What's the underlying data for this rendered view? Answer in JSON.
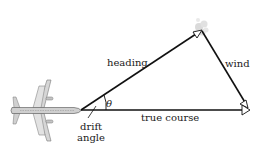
{
  "diagram": {
    "labels": {
      "heading": "heading",
      "wind": "wind",
      "true_course": "true course",
      "theta": "θ",
      "drift": "drift",
      "angle": "angle"
    },
    "icons": {
      "airplane": "airplane-icon",
      "cloud": "cloud-puff-icon"
    },
    "colors": {
      "line": "#111111",
      "background": "#ffffff",
      "airplane": "#c8c8c8"
    }
  }
}
